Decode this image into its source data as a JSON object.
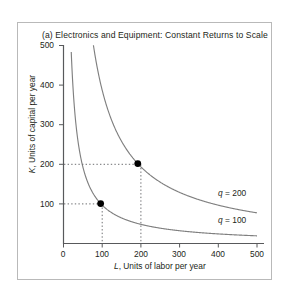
{
  "figure": {
    "title": "(a) Electronics and Equipment: Constant Returns to Scale"
  },
  "chart_data": {
    "type": "line",
    "title": "(a) Electronics and Equipment: Constant Returns to Scale",
    "xlabel": "L, Units of labor per year",
    "ylabel": "K, Units of capital per year",
    "xlabel_symbol": "L",
    "xlabel_text": ", Units of labor per year",
    "ylabel_symbol": "K",
    "ylabel_text": ", Units of capital per year",
    "xlim": [
      0,
      540
    ],
    "ylim": [
      0,
      540
    ],
    "xticks": [
      0,
      100,
      200,
      300,
      400,
      500
    ],
    "xticklabels": [
      "0",
      "100",
      "200",
      "300",
      "400",
      "500"
    ],
    "yticks": [
      100,
      200,
      300,
      400,
      500
    ],
    "yticklabels": [
      "100",
      "200",
      "300",
      "400",
      "500"
    ],
    "grid": false,
    "legend": "inline-curve-labels",
    "series": [
      {
        "name": "q = 100",
        "label_symbol": "q",
        "label_value": "= 100",
        "curve": "isoquant",
        "constant": 10000,
        "points": [
          {
            "x": 20,
            "y": 500
          },
          {
            "x": 25,
            "y": 400
          },
          {
            "x": 33,
            "y": 300
          },
          {
            "x": 50,
            "y": 200
          },
          {
            "x": 100,
            "y": 100
          },
          {
            "x": 200,
            "y": 50
          },
          {
            "x": 300,
            "y": 33
          },
          {
            "x": 400,
            "y": 25
          },
          {
            "x": 500,
            "y": 20
          }
        ],
        "label_position": {
          "x": 330,
          "y": 70
        }
      },
      {
        "name": "q = 200",
        "label_symbol": "q",
        "label_value": "= 200",
        "curve": "isoquant",
        "constant": 40000,
        "points": [
          {
            "x": 80,
            "y": 500
          },
          {
            "x": 100,
            "y": 400
          },
          {
            "x": 133,
            "y": 300
          },
          {
            "x": 200,
            "y": 200
          },
          {
            "x": 267,
            "y": 150
          },
          {
            "x": 400,
            "y": 100
          },
          {
            "x": 500,
            "y": 80
          }
        ],
        "label_position": {
          "x": 330,
          "y": 140
        }
      }
    ],
    "markers": [
      {
        "x": 100,
        "y": 100,
        "on_series": "q = 100",
        "style": "filled-circle"
      },
      {
        "x": 200,
        "y": 200,
        "on_series": "q = 200",
        "style": "filled-circle"
      }
    ],
    "annotations": [
      {
        "type": "dotted-guide",
        "from": {
          "x": 0,
          "y": 100
        },
        "to": {
          "x": 100,
          "y": 100
        }
      },
      {
        "type": "dotted-guide",
        "from": {
          "x": 100,
          "y": 100
        },
        "to": {
          "x": 100,
          "y": 0
        }
      },
      {
        "type": "dotted-guide",
        "from": {
          "x": 0,
          "y": 200
        },
        "to": {
          "x": 200,
          "y": 200
        }
      },
      {
        "type": "dotted-guide",
        "from": {
          "x": 200,
          "y": 200
        },
        "to": {
          "x": 200,
          "y": 0
        }
      }
    ],
    "colors": {
      "curve": "#808080",
      "axis": "#58595b",
      "marker": "#000000",
      "dotted": "#6d6e71",
      "frame": "#b9b9b9",
      "text": "#231f20",
      "background": "#ffffff"
    }
  }
}
